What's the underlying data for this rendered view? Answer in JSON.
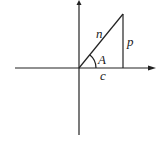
{
  "diagram": {
    "type": "right-triangle-on-axes",
    "labels": {
      "hypotenuse": "n",
      "opposite": "p",
      "adjacent": "c",
      "angle": "A"
    },
    "colors": {
      "ink": "#222222",
      "background": "#ffffff"
    }
  }
}
